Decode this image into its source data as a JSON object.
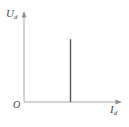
{
  "figure": {
    "background_color": "#ffffff",
    "width": 129,
    "height": 127,
    "origin_label": "O"
  },
  "labels": {
    "y_symbol": "U",
    "y_subscript": "d",
    "x_symbol": "I",
    "x_subscript": "d"
  },
  "colors": {
    "axis": "#a8a8a8",
    "spike": "#555555",
    "text": "#4a4a4a",
    "background": "#ffffff"
  },
  "chart_data": {
    "type": "line",
    "title": "",
    "subtitle": "",
    "xlabel": "Id",
    "ylabel": "Ud",
    "grid": false,
    "legend": null,
    "xlim": [
      0,
      1
    ],
    "ylim": [
      0,
      1
    ],
    "axis_arrows": true,
    "tick_labels_x": [],
    "tick_labels_y": [],
    "annotations": [],
    "series": [
      {
        "name": "ideal-voltage-source-characteristic",
        "type": "vertical-line",
        "x": 0.5,
        "y_start": 0.0,
        "y_end": 0.73,
        "color": "#555555",
        "linewidth": 1.4
      }
    ]
  }
}
